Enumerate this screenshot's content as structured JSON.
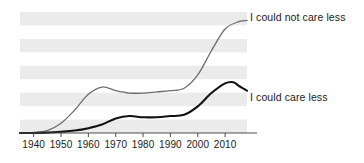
{
  "chart_data": {
    "type": "line",
    "title": "",
    "subtitle": "",
    "xlabel": "",
    "ylabel": "",
    "xlim": [
      1935,
      2018
    ],
    "ylim": [
      0,
      100
    ],
    "grid": "horizontal-alternating-bands",
    "legend_position": "right-inline-labels",
    "xticks": [
      1940,
      1950,
      1960,
      1970,
      1980,
      1990,
      2000,
      2010
    ],
    "xtick_labels": [
      "1940",
      "1950",
      "1960",
      "1970",
      "1980",
      "1990",
      "2000",
      "2010"
    ],
    "yticks": [],
    "ytick_labels": [],
    "series": [
      {
        "name": "I could not care less",
        "color": "#6e6e6e",
        "width": 1.3,
        "x": [
          1935,
          1940,
          1945,
          1950,
          1955,
          1960,
          1965,
          1970,
          1975,
          1980,
          1985,
          1990,
          1995,
          2000,
          2005,
          2010,
          2015,
          2018
        ],
        "values": [
          0,
          0.5,
          2,
          8,
          19,
          32,
          38,
          35,
          33,
          33,
          34,
          35,
          37,
          48,
          68,
          86,
          92,
          93
        ]
      },
      {
        "name": "I could care less",
        "color": "#111111",
        "width": 2.1,
        "x": [
          1935,
          1940,
          1945,
          1950,
          1955,
          1960,
          1965,
          1970,
          1975,
          1980,
          1985,
          1990,
          1995,
          2000,
          2005,
          2010,
          2013,
          2015,
          2018
        ],
        "values": [
          0,
          0,
          0.3,
          1,
          2,
          4,
          7,
          12,
          14,
          13,
          13,
          14,
          15,
          22,
          33,
          41,
          42,
          39,
          35
        ]
      }
    ],
    "annotations": [
      {
        "name": "I could not care less",
        "at_x": 2018
      },
      {
        "name": "I could care less",
        "at_x": 2018
      }
    ]
  },
  "axis": {
    "baseline_color": "#4d4d4d",
    "tick_color": "#4d4d4d"
  },
  "bands": {
    "color": "#ebebeb",
    "count": 5
  }
}
